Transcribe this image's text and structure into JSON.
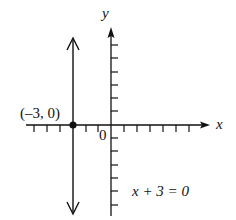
{
  "diagram": {
    "axes": {
      "x_label": "x",
      "y_label": "y",
      "origin_label": "0"
    },
    "point_label": "(–3, 0)",
    "equation_label": "x + 3 = 0",
    "point": {
      "x": -3,
      "y": 0
    },
    "line": "vertical line x = -3",
    "colors": {
      "ink": "#111111",
      "background": "#ffffff"
    }
  }
}
